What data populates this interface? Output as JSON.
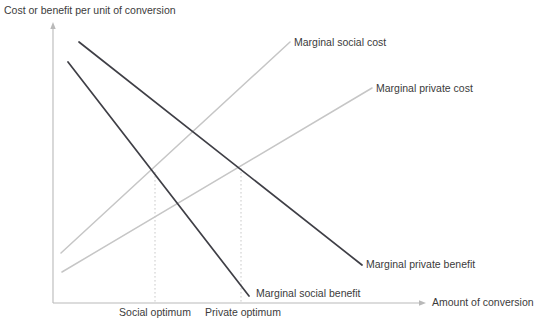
{
  "figure": {
    "title_axis_y": "Cost or benefit per unit of conversion",
    "title_axis_x": "Amount of conversion",
    "background_color": "#ffffff",
    "cost_curve_color": "#c6c6c6",
    "benefit_curve_color": "#3f3f46",
    "axis_color": "#b9b9b9",
    "guide_color": "#c9c9c9"
  },
  "curve_labels": {
    "marginal_social_cost": "Marginal social cost",
    "marginal_private_cost": "Marginal private cost",
    "marginal_private_benefit": "Marginal private benefit",
    "marginal_social_benefit": "Marginal social benefit"
  },
  "tick_labels": {
    "social_optimum": "Social optimum",
    "private_optimum": "Private optimum"
  },
  "chart_data": {
    "type": "line",
    "title": "",
    "xlabel": "Amount of conversion",
    "ylabel": "Cost or benefit per unit of conversion",
    "grid": false,
    "legend": "inline-end-of-line labels",
    "axis_style": "arrowed, unlabeled scale",
    "xlim": [
      0,
      1
    ],
    "ylim": [
      0,
      1
    ],
    "series": [
      {
        "name": "Marginal social cost",
        "kind": "cost",
        "slope": "upward",
        "color": "#c6c6c6",
        "points": [
          {
            "x_px": 61,
            "y_px": 253
          },
          {
            "x_px": 290,
            "y_px": 42
          }
        ]
      },
      {
        "name": "Marginal private cost",
        "kind": "cost",
        "slope": "upward",
        "color": "#c6c6c6",
        "points": [
          {
            "x_px": 62,
            "y_px": 272
          },
          {
            "x_px": 372,
            "y_px": 88
          }
        ]
      },
      {
        "name": "Marginal private benefit",
        "kind": "benefit",
        "slope": "downward",
        "color": "#3f3f46",
        "points": [
          {
            "x_px": 79,
            "y_px": 42
          },
          {
            "x_px": 362,
            "y_px": 265
          }
        ]
      },
      {
        "name": "Marginal social benefit",
        "kind": "benefit",
        "slope": "downward",
        "color": "#3f3f46",
        "points": [
          {
            "x_px": 68,
            "y_px": 62
          },
          {
            "x_px": 249,
            "y_px": 296
          }
        ]
      }
    ],
    "annotations": [
      {
        "name": "social optimum",
        "label": "Social optimum",
        "type": "vertical dotted drop line at intersection of Marginal social cost and Marginal social benefit",
        "x_px": 155,
        "y_top_px": 172,
        "y_bottom_px": 303
      },
      {
        "name": "private optimum",
        "label": "Private optimum",
        "type": "vertical dotted drop line at intersection of Marginal private cost and Marginal private benefit",
        "x_px": 241,
        "y_top_px": 168,
        "y_bottom_px": 303
      }
    ],
    "axes_geometry": {
      "origin_px": {
        "x": 53,
        "y": 303
      },
      "y_axis_top_px": {
        "x": 53,
        "y": 25
      },
      "x_axis_right_px": {
        "x": 424,
        "y": 303
      }
    }
  }
}
